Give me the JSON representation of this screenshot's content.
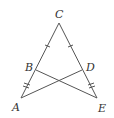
{
  "diagram": {
    "points": {
      "A": {
        "label": "A",
        "x": 21,
        "y": 98
      },
      "B": {
        "label": "B",
        "x": 36,
        "y": 70
      },
      "C": {
        "label": "C",
        "x": 59,
        "y": 23
      },
      "D": {
        "label": "D",
        "x": 82,
        "y": 70
      },
      "E": {
        "label": "E",
        "x": 97,
        "y": 98
      }
    },
    "segments": [
      "CA",
      "CE",
      "BE",
      "DA"
    ],
    "tick_marks": [
      {
        "segment": "CB",
        "count": 1
      },
      {
        "segment": "CD",
        "count": 1
      },
      {
        "segment": "BA",
        "count": 2
      },
      {
        "segment": "DE",
        "count": 2
      }
    ],
    "labels": {
      "A": "A",
      "B": "B",
      "C": "C",
      "D": "D",
      "E": "E"
    }
  }
}
